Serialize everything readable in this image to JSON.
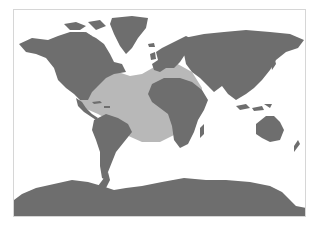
{
  "map": {
    "projection": "world-equirectangular-like",
    "colors": {
      "background": "#ffffff",
      "land": "#6e6e6e",
      "highlight_region": "#b8b8b8",
      "frame_border": "#d6d6d6"
    },
    "highlighted_region": {
      "description": "North and Central Atlantic Ocean, including Caribbean Sea and Gulf of Mexico"
    },
    "regions": [
      "north-america",
      "greenland",
      "central-america",
      "south-america",
      "europe",
      "africa",
      "asia",
      "australia",
      "new-zealand",
      "madagascar",
      "indonesia",
      "japan",
      "antarctica",
      "iceland",
      "british-isles"
    ]
  }
}
